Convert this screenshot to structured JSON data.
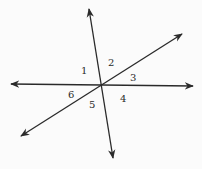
{
  "diagram": {
    "stroke_color": "#2a2a2a",
    "background": "#fbfbfb",
    "intersection": [
      101,
      86
    ],
    "lines": [
      {
        "name": "horizontal-line",
        "from": [
          11,
          84
        ],
        "to": [
          193,
          86
        ]
      },
      {
        "name": "steep-line",
        "from": [
          89,
          9
        ],
        "to": [
          113,
          158
        ]
      },
      {
        "name": "diagonal-line",
        "from": [
          21,
          136
        ],
        "to": [
          182,
          34
        ]
      }
    ],
    "angles": [
      {
        "label": "1",
        "x": 81,
        "y": 74
      },
      {
        "label": "2",
        "x": 108,
        "y": 66
      },
      {
        "label": "3",
        "x": 130,
        "y": 81
      },
      {
        "label": "4",
        "x": 120,
        "y": 102
      },
      {
        "label": "5",
        "x": 89,
        "y": 108
      },
      {
        "label": "6",
        "x": 68,
        "y": 98
      }
    ]
  }
}
